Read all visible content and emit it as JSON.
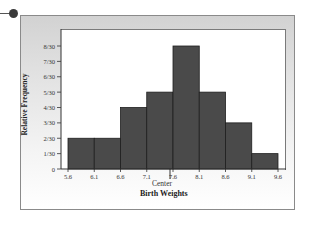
{
  "chart_data": {
    "type": "bar",
    "subtype": "histogram",
    "title": "",
    "xlabel": "Birth Weights",
    "x_annotation": "Center",
    "x_annotation_position": 7.6,
    "ylabel": "Relative Frequency",
    "bin_edges": [
      5.6,
      6.1,
      6.6,
      7.1,
      7.6,
      8.1,
      8.6,
      9.1,
      9.6
    ],
    "x_tick_labels": [
      "5.6",
      "6.1",
      "6.6",
      "7.1",
      "7.6",
      "8.1",
      "8.6",
      "9.1",
      "9.6"
    ],
    "categories": [
      "5.6-6.1",
      "6.1-6.6",
      "6.6-7.1",
      "7.1-7.6",
      "7.6-8.1",
      "8.1-8.6",
      "8.6-9.1",
      "9.1-9.6"
    ],
    "counts": [
      2,
      2,
      4,
      5,
      8,
      5,
      3,
      1
    ],
    "values": [
      0.0667,
      0.0667,
      0.1333,
      0.1667,
      0.2667,
      0.1667,
      0.1,
      0.0333
    ],
    "value_labels": [
      "2/30",
      "2/30",
      "4/30",
      "5/30",
      "8/30",
      "5/30",
      "3/30",
      "1/30"
    ],
    "y_tick_labels": [
      "0",
      "1/30",
      "2/30",
      "3/30",
      "4/30",
      "5/30",
      "6/30",
      "7/30",
      "8/30"
    ],
    "ylim": [
      0,
      0.3
    ],
    "grid": false,
    "legend": null,
    "bar_color": "#4a4a4a"
  },
  "labels": {
    "ylabel": "Relative Frequency",
    "xsub": "Center",
    "xtitle": "Birth Weights"
  }
}
